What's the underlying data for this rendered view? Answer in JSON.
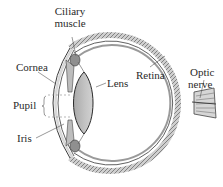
{
  "diagram": {
    "labels": {
      "ciliary_muscle_line1": "Ciliary",
      "ciliary_muscle_line2": "muscle",
      "cornea": "Cornea",
      "retina": "Retina",
      "optic_nerve_line1": "Optic",
      "optic_nerve_line2": "nerve",
      "lens": "Lens",
      "pupil": "Pupil",
      "iris": "Iris"
    },
    "colors": {
      "outline": "#3a3a3a",
      "sclera_fill": "#d9d9d9",
      "lens_fill": "#b8b8b8",
      "retina_texture": "#7a7a7a",
      "leader_line": "#555555",
      "background": "#ffffff"
    }
  }
}
